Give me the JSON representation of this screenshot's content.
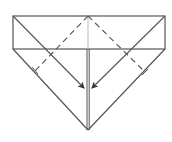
{
  "diagram": {
    "type": "origami-fold-step",
    "colors": {
      "background": "#ffffff",
      "line": "#555555",
      "center_line": "#aaaaaa",
      "arrow": "#333333"
    },
    "shapes": {
      "band": {
        "x1": 13,
        "y1": 16,
        "x2": 165,
        "y2": 49
      },
      "apex_bottom": {
        "x": 88,
        "y": 130
      },
      "apex_top": {
        "x": 88,
        "y": 16
      }
    },
    "folds": [
      {
        "name": "left-valley-fold",
        "style": "dashed",
        "from": [
          88,
          16
        ],
        "to": [
          35,
          70
        ]
      },
      {
        "name": "right-valley-fold",
        "style": "dashed",
        "from": [
          88,
          16
        ],
        "to": [
          145,
          72
        ]
      }
    ],
    "arrows": [
      {
        "name": "left-fold-arrow",
        "from": [
          13,
          16
        ],
        "to": [
          84,
          88
        ]
      },
      {
        "name": "right-fold-arrow",
        "from": [
          165,
          16
        ],
        "to": [
          92,
          88
        ]
      }
    ]
  }
}
